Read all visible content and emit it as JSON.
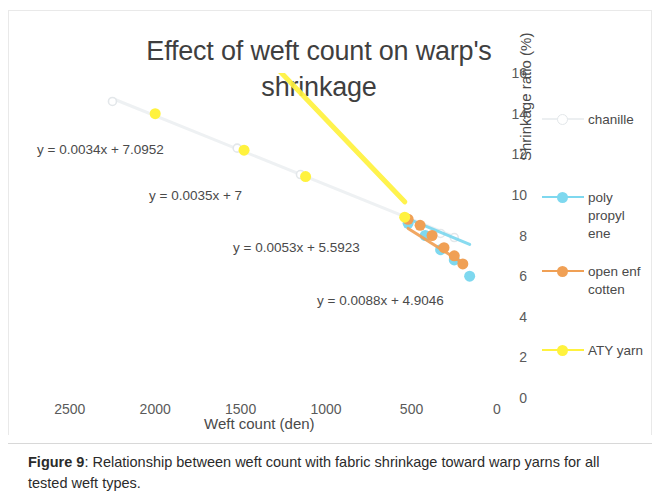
{
  "figure": {
    "caption_label": "Figure 9",
    "caption_sep": ": ",
    "caption_text": "Relationship between weft count with fabric shrinkage toward warp yarns for all tested weft types."
  },
  "chart_data": {
    "type": "scatter",
    "title": "Effect of weft count on warp's shrinkage",
    "xlabel": "Weft count (den)",
    "ylabel": "Shrinkage ratio (%)",
    "xlim": [
      2750,
      0
    ],
    "ylim": [
      0,
      16
    ],
    "x_reversed": true,
    "grid": false,
    "legend_position": "right",
    "x_ticks": [
      "2500",
      "2000",
      "1500",
      "1000",
      "500",
      "0"
    ],
    "x_tick_values": [
      2500,
      2000,
      1500,
      1000,
      500,
      0
    ],
    "y_ticks": [
      "16",
      "14",
      "12",
      "10",
      "8",
      "6",
      "4",
      "2",
      "0"
    ],
    "y_tick_values": [
      16,
      14,
      12,
      10,
      8,
      6,
      4,
      2,
      0
    ],
    "series": [
      {
        "name": "chanille",
        "color": "#eceff1",
        "trendline": "y = 0.0034x + 7.0952",
        "points": [
          {
            "x": 2250,
            "y": 14.6
          },
          {
            "x": 1520,
            "y": 12.3
          },
          {
            "x": 1150,
            "y": 11.0
          },
          {
            "x": 520,
            "y": 8.7
          },
          {
            "x": 330,
            "y": 8.1
          },
          {
            "x": 250,
            "y": 7.9
          }
        ]
      },
      {
        "name": "poly propyl ene",
        "color": "#7ed8ef",
        "trendline": "y = 0.0035x + 7",
        "points": [
          {
            "x": 520,
            "y": 8.6
          },
          {
            "x": 420,
            "y": 8.0
          },
          {
            "x": 330,
            "y": 7.3
          },
          {
            "x": 250,
            "y": 6.8
          },
          {
            "x": 160,
            "y": 6.0
          }
        ]
      },
      {
        "name": "open enf cotten",
        "color": "#f0a055",
        "trendline": "y = 0.0053x + 5.5923",
        "points": [
          {
            "x": 520,
            "y": 8.8
          },
          {
            "x": 450,
            "y": 8.5
          },
          {
            "x": 380,
            "y": 8.0
          },
          {
            "x": 310,
            "y": 7.4
          },
          {
            "x": 250,
            "y": 7.0
          },
          {
            "x": 200,
            "y": 6.6
          }
        ]
      },
      {
        "name": "ATY yarn",
        "color": "#fff23e",
        "trendline": "y = 0.0088x + 4.9046",
        "points": [
          {
            "x": 2000,
            "y": 14.0
          },
          {
            "x": 1480,
            "y": 12.2
          },
          {
            "x": 1120,
            "y": 10.9
          },
          {
            "x": 540,
            "y": 8.9
          }
        ]
      }
    ],
    "equations": [
      {
        "text": "y = 0.0034x + 7.0952",
        "left": 28,
        "top": 131
      },
      {
        "text": "y = 0.0035x + 7",
        "left": 140,
        "top": 177
      },
      {
        "text": "y = 0.0053x + 5.5923",
        "left": 224,
        "top": 229
      },
      {
        "text": "y = 0.0088x + 4.9046",
        "left": 308,
        "top": 282
      }
    ],
    "legend": [
      {
        "label": "chanille",
        "color": "#eceff1",
        "top": 0
      },
      {
        "label": "poly propyl ene",
        "color": "#7ed8ef",
        "top": 78
      },
      {
        "label": "open enf cotten",
        "color": "#f0a055",
        "top": 152
      },
      {
        "label": "ATY yarn",
        "color": "#fff23e",
        "top": 231
      }
    ]
  }
}
